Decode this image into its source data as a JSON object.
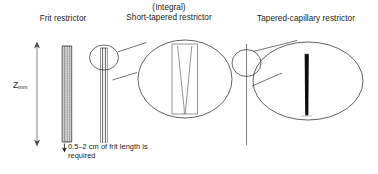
{
  "figure": {
    "background_color": "#ffffff",
    "line_color": "#2b2b2b",
    "fill_dark": "#111111",
    "fill_hatch": "#8a8a8a"
  },
  "titles": {
    "frit": "Frit restrictor",
    "short_tapered_line1": "(Integral)",
    "short_tapered_line2": "Short-tapered restrictor",
    "tapered_capillary": "Tapered-capillary restrictor"
  },
  "axis": {
    "symbol": "Z",
    "subscript": "mm"
  },
  "annotations": {
    "frit_length_note": "0.5–2 cm of frit length is required"
  },
  "icons": {
    "axis_arrow": "double-headed-vertical-arrow",
    "note_arrow": "down-arrow",
    "callout_small": "magnifier-circle",
    "callout_large": "magnified-detail-ellipse"
  }
}
